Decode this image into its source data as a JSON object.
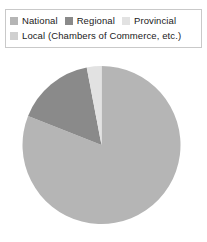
{
  "legend": {
    "rows": [
      [
        {
          "label": "National",
          "color": "#b5b5b5"
        },
        {
          "label": "Regional",
          "color": "#8a8a8a"
        },
        {
          "label": "Provincial",
          "color": "#e2e2e2"
        }
      ],
      [
        {
          "label": "Local (Chambers of Commerce, etc.)",
          "color": "#d0d0d0"
        }
      ]
    ],
    "border_color": "#c9c9c9"
  },
  "chart_data": {
    "type": "pie",
    "title": "",
    "categories": [
      "National",
      "Regional",
      "Provincial",
      "Local (Chambers of Commerce, etc.)"
    ],
    "values": [
      81,
      16,
      3,
      0
    ],
    "value_unit": "%",
    "colors": [
      "#b5b5b5",
      "#8a8a8a",
      "#e2e2e2",
      "#d0d0d0"
    ],
    "start_angle_deg": 0,
    "direction": "clockwise",
    "legend_position": "top",
    "grid": false,
    "labels_shown": false,
    "center": {
      "cx": 80.5,
      "cy": 81,
      "r": 79
    }
  }
}
